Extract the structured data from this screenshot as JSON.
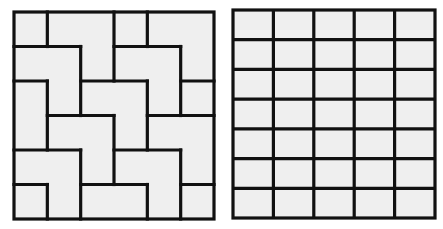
{
  "colors": {
    "background": "#ffffff",
    "cell_fill": "#efefef",
    "line": "#111111"
  },
  "left_grid": {
    "name": "tiled-puzzle-grid",
    "x": 14,
    "y": 12,
    "width": 200,
    "height": 207,
    "cols": 6,
    "rows": 6,
    "stroke_width": 3.2,
    "horizontal_segments": [
      {
        "row": 1,
        "from": 0,
        "to": 2
      },
      {
        "row": 1,
        "from": 3,
        "to": 5
      },
      {
        "row": 2,
        "from": 0,
        "to": 1
      },
      {
        "row": 2,
        "from": 2,
        "to": 4
      },
      {
        "row": 2,
        "from": 5,
        "to": 6
      },
      {
        "row": 3,
        "from": 1,
        "to": 3
      },
      {
        "row": 3,
        "from": 4,
        "to": 6
      },
      {
        "row": 4,
        "from": 0,
        "to": 2
      },
      {
        "row": 4,
        "from": 3,
        "to": 5
      },
      {
        "row": 5,
        "from": 0,
        "to": 1
      },
      {
        "row": 5,
        "from": 2,
        "to": 4
      },
      {
        "row": 5,
        "from": 5,
        "to": 6
      }
    ],
    "vertical_segments": [
      {
        "col": 1,
        "from": 0,
        "to": 1
      },
      {
        "col": 1,
        "from": 2,
        "to": 4
      },
      {
        "col": 1,
        "from": 5,
        "to": 6
      },
      {
        "col": 2,
        "from": 1,
        "to": 3
      },
      {
        "col": 2,
        "from": 4,
        "to": 6
      },
      {
        "col": 3,
        "from": 0,
        "to": 2
      },
      {
        "col": 3,
        "from": 3,
        "to": 5
      },
      {
        "col": 4,
        "from": 0,
        "to": 1
      },
      {
        "col": 4,
        "from": 2,
        "to": 4
      },
      {
        "col": 4,
        "from": 5,
        "to": 6
      },
      {
        "col": 5,
        "from": 1,
        "to": 3
      },
      {
        "col": 5,
        "from": 4,
        "to": 6
      }
    ]
  },
  "right_grid": {
    "name": "regular-grid",
    "x": 233,
    "y": 10,
    "width": 202,
    "height": 208,
    "cols": 5,
    "rows": 7,
    "stroke_width": 3.2
  }
}
